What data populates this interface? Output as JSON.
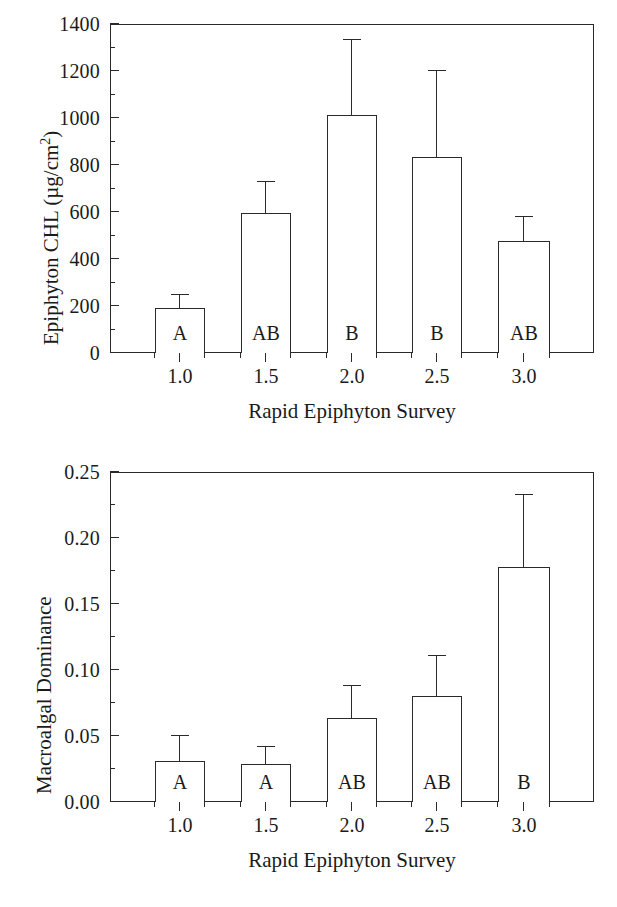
{
  "figure": {
    "background": "#ffffff",
    "ink_color": "#2a2a2a"
  },
  "chart_data": [
    {
      "panel": "top",
      "type": "bar",
      "title": "",
      "xlabel": "Rapid Epiphyton Survey",
      "ylabel": "Epiphyton CHL (µg/cm²)",
      "ylabel_parts": {
        "main": "Epiphyton CHL (µg/cm",
        "sup": "2",
        "tail": ")"
      },
      "categories": [
        "1.0",
        "1.5",
        "2.0",
        "2.5",
        "3.0"
      ],
      "values": [
        190,
        595,
        1012,
        835,
        478
      ],
      "errors_upper": [
        250,
        730,
        1335,
        1200,
        578
      ],
      "annotations": [
        "A",
        "AB",
        "B",
        "B",
        "AB"
      ],
      "ylim": [
        0,
        1400
      ],
      "ytick_labels": [
        "0",
        "200",
        "400",
        "600",
        "800",
        "1000",
        "1200",
        "1400"
      ],
      "ytick_values": [
        0,
        200,
        400,
        600,
        800,
        1000,
        1200,
        1400
      ],
      "yminor_step": 100,
      "grid": "off",
      "legend": "none",
      "error_bar_style": "upper-only-with-cap"
    },
    {
      "panel": "bottom",
      "type": "bar",
      "title": "",
      "xlabel": "Rapid Epiphyton Survey",
      "ylabel": "Macroalgal Dominance",
      "categories": [
        "1.0",
        "1.5",
        "2.0",
        "2.5",
        "3.0"
      ],
      "values": [
        0.031,
        0.029,
        0.064,
        0.08,
        0.178
      ],
      "errors_upper": [
        0.05,
        0.042,
        0.088,
        0.111,
        0.233
      ],
      "annotations": [
        "A",
        "A",
        "AB",
        "AB",
        "B"
      ],
      "ylim": [
        0,
        0.25
      ],
      "ytick_labels": [
        "0.00",
        "0.05",
        "0.10",
        "0.15",
        "0.20",
        "0.25"
      ],
      "ytick_values": [
        0,
        0.05,
        0.1,
        0.15,
        0.2,
        0.25
      ],
      "yminor_step": 0.025,
      "grid": "off",
      "legend": "none",
      "error_bar_style": "upper-only-with-cap"
    }
  ]
}
